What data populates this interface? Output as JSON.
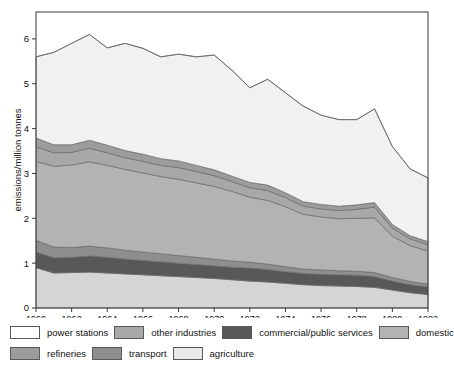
{
  "chart_data": {
    "type": "area",
    "stacked": true,
    "title": "",
    "xlabel": "",
    "ylabel": "emissions/million tonnes",
    "xlim": [
      1960,
      1982
    ],
    "ylim": [
      0,
      6.6
    ],
    "yticks": [
      0,
      1,
      2,
      3,
      4,
      5,
      6
    ],
    "xticks": [
      1960,
      1962,
      1964,
      1966,
      1968,
      1970,
      1972,
      1974,
      1976,
      1978,
      1980,
      1982
    ],
    "xticklabels": [
      "1960",
      "1962",
      "1964",
      "1966",
      "1968",
      "1970",
      "1972",
      "1974",
      "1976",
      "1978",
      "1980",
      "1982"
    ],
    "yticklabels": [
      "0",
      "1",
      "2",
      "3",
      "4",
      "5",
      "6"
    ],
    "grid": false,
    "legend_position": "below",
    "x": [
      1960,
      1961,
      1962,
      1963,
      1964,
      1965,
      1966,
      1967,
      1968,
      1969,
      1970,
      1971,
      1972,
      1973,
      1974,
      1975,
      1976,
      1977,
      1978,
      1979,
      1980,
      1981,
      1982
    ],
    "series": [
      {
        "name": "agriculture",
        "color": "#d5d5d5",
        "values": [
          0.9,
          0.78,
          0.79,
          0.8,
          0.78,
          0.76,
          0.74,
          0.72,
          0.7,
          0.68,
          0.66,
          0.63,
          0.6,
          0.58,
          0.55,
          0.52,
          0.5,
          0.49,
          0.48,
          0.46,
          0.4,
          0.34,
          0.3
        ]
      },
      {
        "name": "commercial/public services",
        "color": "#585858",
        "values": [
          0.35,
          0.34,
          0.34,
          0.36,
          0.35,
          0.33,
          0.32,
          0.31,
          0.3,
          0.29,
          0.28,
          0.28,
          0.29,
          0.28,
          0.26,
          0.25,
          0.25,
          0.25,
          0.25,
          0.24,
          0.2,
          0.18,
          0.17
        ]
      },
      {
        "name": "transport",
        "color": "#8e8e8e",
        "values": [
          0.26,
          0.24,
          0.22,
          0.22,
          0.21,
          0.2,
          0.19,
          0.18,
          0.17,
          0.16,
          0.15,
          0.14,
          0.13,
          0.12,
          0.11,
          0.1,
          0.1,
          0.09,
          0.09,
          0.09,
          0.08,
          0.07,
          0.06
        ]
      },
      {
        "name": "domestic",
        "color": "#b3b3b3",
        "values": [
          1.76,
          1.8,
          1.84,
          1.88,
          1.84,
          1.8,
          1.76,
          1.72,
          1.7,
          1.66,
          1.62,
          1.55,
          1.45,
          1.42,
          1.34,
          1.22,
          1.18,
          1.16,
          1.18,
          1.22,
          0.92,
          0.8,
          0.74
        ]
      },
      {
        "name": "other industries",
        "color": "#a8a8a8",
        "values": [
          0.32,
          0.3,
          0.28,
          0.3,
          0.28,
          0.26,
          0.26,
          0.25,
          0.26,
          0.25,
          0.24,
          0.22,
          0.21,
          0.22,
          0.2,
          0.18,
          0.18,
          0.18,
          0.2,
          0.24,
          0.18,
          0.15,
          0.14
        ]
      },
      {
        "name": "refineries",
        "color": "#9c9c9c",
        "values": [
          0.2,
          0.18,
          0.17,
          0.18,
          0.17,
          0.16,
          0.16,
          0.15,
          0.15,
          0.14,
          0.13,
          0.12,
          0.12,
          0.12,
          0.11,
          0.1,
          0.1,
          0.1,
          0.1,
          0.1,
          0.08,
          0.07,
          0.07
        ]
      },
      {
        "name": "power stations",
        "color": "#f1f1f1",
        "values": [
          1.81,
          2.06,
          2.26,
          2.36,
          2.17,
          2.39,
          2.36,
          2.27,
          2.38,
          2.42,
          2.56,
          2.36,
          2.11,
          2.36,
          2.23,
          2.13,
          1.99,
          1.93,
          1.9,
          2.09,
          1.74,
          1.49,
          1.42
        ]
      }
    ],
    "totals": [
      5.6,
      5.7,
      5.9,
      6.1,
      5.8,
      5.9,
      6.0,
      5.6,
      6.2,
      5.95,
      5.9,
      5.75,
      5.75,
      5.8,
      5.6,
      5.4,
      5.1,
      5.1,
      5.1,
      5.35,
      4.8,
      4.4,
      4.2
    ]
  },
  "legend": {
    "items": [
      {
        "label": "power stations",
        "swatch": "#ffffff"
      },
      {
        "label": "other industries",
        "swatch": "#a8a8a8"
      },
      {
        "label": "commercial/public services",
        "swatch": "#585858"
      },
      {
        "label": "domestic",
        "swatch": "#b3b3b3"
      },
      {
        "label": "refineries",
        "swatch": "#9c9c9c"
      },
      {
        "label": "transport",
        "swatch": "#8e8e8e"
      },
      {
        "label": "agriculture",
        "swatch": "#e9e9e9"
      }
    ]
  },
  "axes": {
    "ylabel": "emissions/million tonnes"
  }
}
